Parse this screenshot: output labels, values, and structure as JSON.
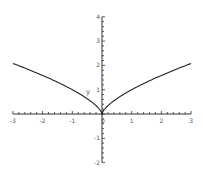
{
  "chart_data": {
    "type": "line",
    "title": "",
    "xlabel": "",
    "ylabel": "y",
    "xlim": [
      -3,
      3
    ],
    "ylim": [
      -2,
      4
    ],
    "grid": false,
    "legend": null,
    "x_ticks": [
      "-3",
      "-2",
      "-1",
      "0",
      "1",
      "2",
      "3"
    ],
    "y_ticks": [
      "-2",
      "-1",
      "1",
      "2",
      "3",
      "4"
    ],
    "series": [
      {
        "name": "y = x^(2/3)",
        "x": [
          -3,
          -2.5,
          -2,
          -1.5,
          -1,
          -0.5,
          -0.25,
          -0.1,
          0,
          0.1,
          0.25,
          0.5,
          1,
          1.5,
          2,
          2.5,
          3
        ],
        "values": [
          2.08,
          1.84,
          1.59,
          1.31,
          1.0,
          0.63,
          0.4,
          0.22,
          0,
          0.22,
          0.4,
          0.63,
          1.0,
          1.31,
          1.59,
          1.84,
          2.08
        ]
      }
    ],
    "colors": {
      "curve": "#222222",
      "axes": "#333333",
      "labels": "#555555"
    }
  }
}
